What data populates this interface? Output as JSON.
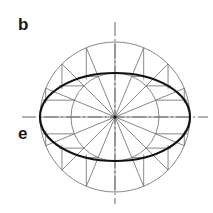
{
  "labels": {
    "top_left": "b",
    "left_axis": "e"
  },
  "figure": {
    "center": [
      115,
      117
    ],
    "outer_circle_radius": 75,
    "inner_circle_radius": 44,
    "divisions": 16,
    "axis_extent": {
      "h": [
        22,
        208
      ],
      "v": [
        22,
        204
      ]
    },
    "colors": {
      "construction": "#6a6a6a",
      "ellipse": "#111111",
      "axis": "#555555",
      "background": "#ffffff"
    },
    "stroke_widths": {
      "construction": 0.8,
      "ellipse": 2.2,
      "axis": 0.9
    }
  }
}
